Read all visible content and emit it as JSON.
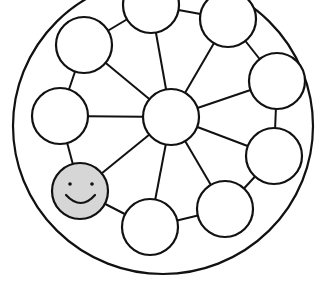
{
  "diagram": {
    "colors": {
      "stroke": "#111111",
      "node_fill": "#ffffff",
      "highlight_fill": "#d6d6d6",
      "background": "#ffffff"
    },
    "outer_ring": {
      "cx": 163,
      "cy": 126,
      "rx": 150,
      "ry": 148
    },
    "hub": {
      "id": "hub",
      "cx": 171,
      "cy": 117,
      "r": 28
    },
    "nodes": [
      {
        "id": "n1",
        "cx": 84,
        "cy": 45,
        "r": 28,
        "highlight": false
      },
      {
        "id": "n2",
        "cx": 151,
        "cy": 5,
        "r": 28,
        "highlight": false
      },
      {
        "id": "n3",
        "cx": 228,
        "cy": 19,
        "r": 28,
        "highlight": false
      },
      {
        "id": "n4",
        "cx": 277,
        "cy": 81,
        "r": 28,
        "highlight": false
      },
      {
        "id": "n5",
        "cx": 274,
        "cy": 156,
        "r": 28,
        "highlight": false
      },
      {
        "id": "n6",
        "cx": 225,
        "cy": 209,
        "r": 28,
        "highlight": false
      },
      {
        "id": "n7",
        "cx": 150,
        "cy": 227,
        "r": 28,
        "highlight": false
      },
      {
        "id": "n8",
        "cx": 80,
        "cy": 191,
        "r": 28,
        "highlight": true,
        "icon": "smiley-face-icon"
      },
      {
        "id": "n9",
        "cx": 60,
        "cy": 116,
        "r": 28,
        "highlight": false
      }
    ],
    "ring_links": [
      [
        "n1",
        "n2"
      ],
      [
        "n2",
        "n3"
      ],
      [
        "n3",
        "n4"
      ],
      [
        "n4",
        "n5"
      ],
      [
        "n5",
        "n6"
      ],
      [
        "n6",
        "n7"
      ],
      [
        "n7",
        "n8"
      ],
      [
        "n8",
        "n9"
      ],
      [
        "n9",
        "n1"
      ]
    ],
    "hub_links": [
      "n1",
      "n2",
      "n3",
      "n4",
      "n5",
      "n6",
      "n7",
      "n8",
      "n9"
    ]
  }
}
